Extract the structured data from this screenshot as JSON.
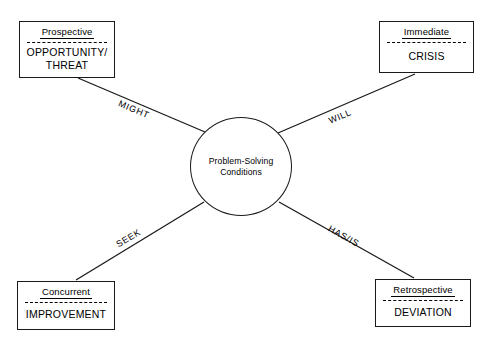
{
  "diagram": {
    "center": {
      "label": "Problem-Solving\nConditions",
      "line1": "Problem-Solving",
      "line2": "Conditions"
    },
    "nodes": [
      {
        "id": "prospective",
        "title": "Prospective",
        "body": "OPPORTUNITY/\nTHREAT",
        "body_line1": "OPPORTUNITY/",
        "body_line2": "THREAT",
        "position": "top-left"
      },
      {
        "id": "immediate",
        "title": "Immediate",
        "body": "CRISIS",
        "body_line1": "CRISIS",
        "body_line2": "",
        "position": "top-right"
      },
      {
        "id": "concurrent",
        "title": "Concurrent",
        "body": "IMPROVEMENT",
        "body_line1": "IMPROVEMENT",
        "body_line2": "",
        "position": "bottom-left"
      },
      {
        "id": "retrospective",
        "title": "Retrospective",
        "body": "DEVIATION",
        "body_line1": "DEVIATION",
        "body_line2": "",
        "position": "bottom-right"
      }
    ],
    "edges": [
      {
        "id": "edge-might",
        "label": "MIGHT",
        "from": "prospective",
        "to": "center"
      },
      {
        "id": "edge-will",
        "label": "WILL",
        "from": "immediate",
        "to": "center"
      },
      {
        "id": "edge-seek",
        "label": "SEEK",
        "from": "concurrent",
        "to": "center"
      },
      {
        "id": "edge-hasis",
        "label": "HAS/IS",
        "from": "retrospective",
        "to": "center"
      }
    ],
    "colors": {
      "stroke": "#1a1a1a",
      "text": "#000000",
      "background": "#ffffff"
    }
  }
}
